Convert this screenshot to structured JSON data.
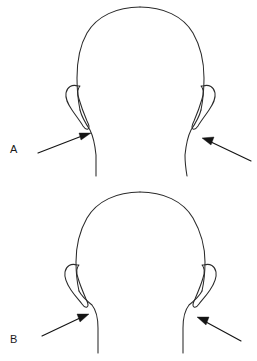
{
  "figure": {
    "type": "medical-illustration",
    "background_color": "#ffffff",
    "line_color": "#2b2b2b",
    "arrow_color": "#141414",
    "width": 257,
    "height": 361
  },
  "panels": [
    {
      "id": "a",
      "label": "A",
      "label_position": {
        "x": 10,
        "y": 144
      },
      "view": "posterior head and neck",
      "neck_contour": "wide",
      "arrows": [
        {
          "side": "left",
          "direction": "up-right",
          "tail": {
            "x": 38,
            "y": 153
          },
          "tip": {
            "x": 91,
            "y": 133
          }
        },
        {
          "side": "right",
          "direction": "up-left",
          "tail": {
            "x": 251,
            "y": 161
          },
          "tip": {
            "x": 202,
            "y": 138
          }
        }
      ],
      "ears": [
        {
          "side": "left",
          "x": 74,
          "y": 86
        },
        {
          "side": "right",
          "x": 196,
          "y": 86
        }
      ]
    },
    {
      "id": "b",
      "label": "B",
      "label_position": {
        "x": 10,
        "y": 334
      },
      "view": "posterior head and neck",
      "neck_contour": "narrow",
      "arrows": [
        {
          "side": "left",
          "direction": "up-right",
          "tail": {
            "x": 42,
            "y": 336
          },
          "tip": {
            "x": 89,
            "y": 314
          }
        },
        {
          "side": "right",
          "direction": "up-left",
          "tail": {
            "x": 241,
            "y": 341
          },
          "tip": {
            "x": 197,
            "y": 317
          }
        }
      ],
      "ears": [
        {
          "side": "left",
          "x": 72,
          "y": 262
        },
        {
          "side": "right",
          "x": 198,
          "y": 262
        }
      ]
    }
  ],
  "labels": {
    "panel_a": "A",
    "panel_b": "B"
  }
}
